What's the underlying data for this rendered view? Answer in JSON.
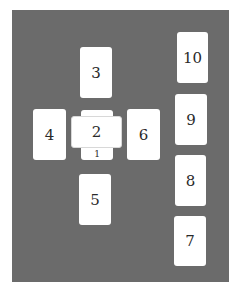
{
  "diagram": {
    "type": "tarot-spread",
    "layout_name": "Celtic Cross",
    "background_color": "#6b6b6b",
    "card_color": "#ffffff",
    "cards": [
      {
        "label": "1",
        "x": 81,
        "y": 110,
        "w": 32,
        "h": 50,
        "orientation": "vertical",
        "note": "underneath card 2"
      },
      {
        "label": "2",
        "x": 71,
        "y": 116,
        "w": 51,
        "h": 32,
        "orientation": "horizontal",
        "note": "crossing card 1"
      },
      {
        "label": "3",
        "x": 80,
        "y": 47,
        "w": 32,
        "h": 51,
        "orientation": "vertical"
      },
      {
        "label": "4",
        "x": 33,
        "y": 109,
        "w": 33,
        "h": 51,
        "orientation": "vertical"
      },
      {
        "label": "5",
        "x": 79,
        "y": 174,
        "w": 32,
        "h": 51,
        "orientation": "vertical"
      },
      {
        "label": "6",
        "x": 127,
        "y": 109,
        "w": 33,
        "h": 51,
        "orientation": "vertical"
      },
      {
        "label": "7",
        "x": 174,
        "y": 216,
        "w": 32,
        "h": 50,
        "orientation": "vertical"
      },
      {
        "label": "8",
        "x": 175,
        "y": 155,
        "w": 31,
        "h": 51,
        "orientation": "vertical"
      },
      {
        "label": "9",
        "x": 175,
        "y": 94,
        "w": 32,
        "h": 51,
        "orientation": "vertical"
      },
      {
        "label": "10",
        "x": 177,
        "y": 32,
        "w": 31,
        "h": 51,
        "orientation": "vertical"
      }
    ]
  }
}
